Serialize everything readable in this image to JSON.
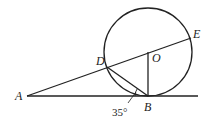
{
  "diagram": {
    "type": "geometry",
    "points": {
      "A": {
        "label": "A",
        "x": 27,
        "y": 96
      },
      "B": {
        "label": "B",
        "x": 148,
        "y": 96
      },
      "D": {
        "label": "D",
        "x": 107,
        "y": 67
      },
      "O": {
        "label": "O",
        "x": 148,
        "y": 52
      },
      "E": {
        "label": "E",
        "x": 191,
        "y": 38
      }
    },
    "circle": {
      "center": "O",
      "cx": 148,
      "cy": 52,
      "r": 44
    },
    "segments": [
      {
        "from": "A",
        "to": "E",
        "name": "secant-ADE"
      },
      {
        "from": "A",
        "to": "tangent-end",
        "name": "tangent-line"
      },
      {
        "from": "O",
        "to": "B",
        "name": "radius-OB"
      },
      {
        "from": "D",
        "to": "B",
        "name": "chord-DB"
      }
    ],
    "angle_annotation": {
      "text": "35°",
      "vertex": "B",
      "between": [
        "BA",
        "BD"
      ]
    },
    "stroke_color": "#222222"
  }
}
